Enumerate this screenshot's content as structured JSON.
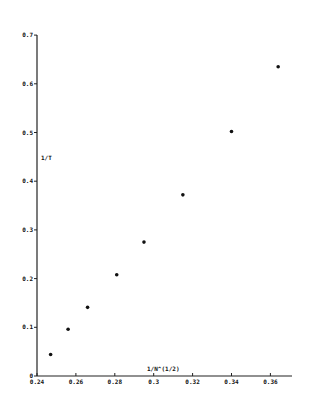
{
  "chart_data": {
    "type": "scatter",
    "title": "",
    "xlabel": "1/N^(1/2)",
    "ylabel": "1/T",
    "xlim": [
      0.24,
      0.37
    ],
    "ylim": [
      0,
      0.7
    ],
    "grid": false,
    "legend": null,
    "x_ticks": [
      "0.24",
      "0.26",
      "0.28",
      "0.3",
      "0.32",
      "0.34",
      "0.36"
    ],
    "y_ticks": [
      "0",
      "0.1",
      "0.2",
      "0.3",
      "0.4",
      "0.5",
      "0.6",
      "0.7"
    ],
    "series": [
      {
        "name": "data",
        "x": [
          0.247,
          0.256,
          0.266,
          0.281,
          0.295,
          0.315,
          0.34,
          0.364
        ],
        "y": [
          0.044,
          0.096,
          0.141,
          0.208,
          0.275,
          0.372,
          0.502,
          0.635
        ]
      }
    ]
  },
  "layout": {
    "origin_px": [
      37,
      376
    ],
    "x_px_per_unit": 1945,
    "y_px_per_unit": 487
  }
}
